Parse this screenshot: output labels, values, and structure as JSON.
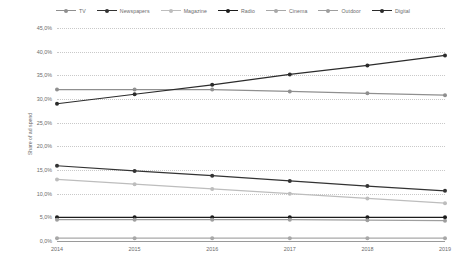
{
  "chart_data": {
    "type": "line",
    "title": "",
    "xlabel": "",
    "ylabel": "Share of ad spend",
    "categories": [
      "2014",
      "2015",
      "2016",
      "2017",
      "2018",
      "2019"
    ],
    "ylim": [
      0,
      45
    ],
    "ytick_labels": [
      "0,0%",
      "5,0%",
      "10,0%",
      "15,0%",
      "20,0%",
      "25,0%",
      "30,0%",
      "35,0%",
      "40,0%",
      "45,0%"
    ],
    "ytick_values": [
      0,
      5,
      10,
      15,
      20,
      25,
      30,
      35,
      40,
      45
    ],
    "grid": true,
    "legend_position": "top",
    "series": [
      {
        "name": "TV",
        "color": "#8f8f8f",
        "values": [
          32.0,
          32.0,
          32.0,
          31.6,
          31.2,
          30.8
        ]
      },
      {
        "name": "Newspapers",
        "color": "#333333",
        "values": [
          15.9,
          14.8,
          13.8,
          12.7,
          11.6,
          10.6
        ]
      },
      {
        "name": "Magazine",
        "color": "#bdbdbd",
        "values": [
          13.0,
          12.0,
          11.0,
          10.0,
          9.0,
          8.0
        ]
      },
      {
        "name": "Radio",
        "color": "#1c1c1c",
        "values": [
          5.0,
          5.0,
          5.0,
          5.0,
          5.0,
          5.0
        ]
      },
      {
        "name": "Cinema",
        "color": "#a8a8a8",
        "values": [
          0.6,
          0.6,
          0.6,
          0.6,
          0.6,
          0.6
        ]
      },
      {
        "name": "Outdoor",
        "color": "#9e9e9e",
        "values": [
          4.5,
          4.5,
          4.5,
          4.5,
          4.4,
          4.3
        ]
      },
      {
        "name": "Digital",
        "color": "#2b2b2b",
        "values": [
          29.0,
          31.0,
          33.0,
          35.2,
          37.1,
          39.2
        ]
      }
    ]
  }
}
